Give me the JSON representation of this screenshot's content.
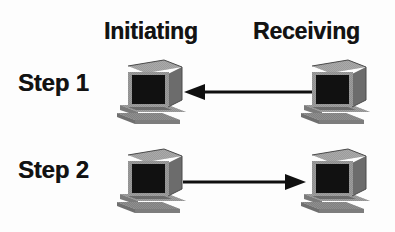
{
  "diagram": {
    "background_color": "#fdfdfd",
    "ink_color": "#121212",
    "headings": {
      "initiating": "Initiating",
      "receiving": "Receiving"
    },
    "steps": [
      {
        "label": "Step 1",
        "arrow_direction": "left",
        "arrow_meaning": "Receiving to Initiating",
        "left_node": "computer-icon",
        "right_node": "computer-icon"
      },
      {
        "label": "Step 2",
        "arrow_direction": "right",
        "arrow_meaning": "Initiating to Receiving",
        "left_node": "computer-icon",
        "right_node": "computer-icon"
      }
    ],
    "icons": {
      "computer": "computer-icon",
      "arrow_left": "arrow-left-icon",
      "arrow_right": "arrow-right-icon"
    },
    "colors": {
      "screen": "#111111",
      "case_front": "#8f8f8f",
      "case_top": "#adadad",
      "case_side": "#6e6e6e",
      "keyboard": "#9a9a9a",
      "keyboard_shadow": "#7a7a7a",
      "arrow": "#101010"
    }
  }
}
